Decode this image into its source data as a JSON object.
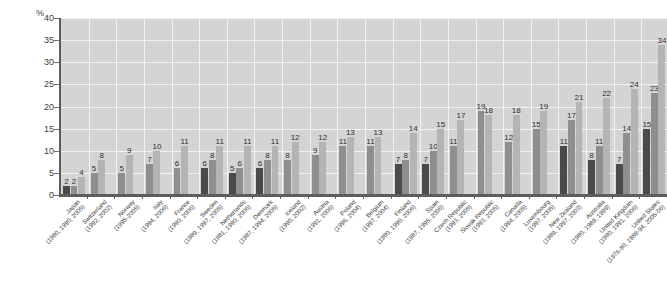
{
  "chart": {
    "type": "bar",
    "title": "",
    "y_unit_label": "%",
    "ylabel": "%",
    "xlabel": "",
    "ylim": [
      0,
      40
    ],
    "y_ticks": [
      0,
      5,
      10,
      15,
      20,
      25,
      30,
      35,
      40
    ],
    "grid": "horizontal-and-vertical",
    "legend": "none",
    "note_last_bar_clipped": "34"
  },
  "chart_data": {
    "type": "bar",
    "title": "",
    "xlabel": "",
    "ylabel": "%",
    "ylim": [
      0,
      40
    ],
    "y_ticks": [
      0,
      5,
      10,
      15,
      20,
      25,
      30,
      35,
      40
    ],
    "grid": true,
    "legend_position": "none",
    "categories": [
      "Japan",
      "Switzerland",
      "Norway",
      "Italy",
      "France",
      "Sweden",
      "Netherlands",
      "Denmark",
      "Iceland",
      "Austria",
      "Poland",
      "Belgium",
      "Finland",
      "Spain",
      "Czech Republic",
      "Slovak Republic",
      "Canada",
      "Luxembourg",
      "New Zealand",
      "Australia",
      "United Kingdom",
      "United States"
    ],
    "category_years": [
      "(1980, 1990, 2005)",
      "(1992, 2002)",
      "(1995-2005)",
      "(1994, 2006)",
      "(1990, 2006)",
      "(1989, 1997, 2005)",
      "(1981, 1990, 2006)",
      "(1987, 1994, 2005)",
      "(1990, 2002)",
      "(1991, 2006)",
      "(1996, 2004)",
      "(1997, 2004)",
      "(1980, 1990, 2006)",
      "(1987, 1995, 2006)",
      "(1993, 2005)",
      "(1993, 2005)",
      "(1994, 2005)",
      "(1997, 2005)",
      "(1989, 1997, 2003)",
      "(1980, 1989, 1999)",
      "(1980, 1991, 2006)",
      "(1976-80, 1988-94, 2005-06)"
    ],
    "bars": [
      {
        "category": "Japan",
        "values": [
          2,
          2,
          4
        ]
      },
      {
        "category": "Switzerland",
        "values": [
          5,
          8
        ]
      },
      {
        "category": "Norway",
        "values": [
          5,
          9
        ]
      },
      {
        "category": "Italy",
        "values": [
          7,
          10
        ]
      },
      {
        "category": "France",
        "values": [
          6,
          11
        ]
      },
      {
        "category": "Sweden",
        "values": [
          6,
          8,
          11
        ]
      },
      {
        "category": "Netherlands",
        "values": [
          5,
          6,
          11
        ]
      },
      {
        "category": "Denmark",
        "values": [
          6,
          8,
          11
        ]
      },
      {
        "category": "Iceland",
        "values": [
          8,
          12
        ]
      },
      {
        "category": "Austria",
        "values": [
          9,
          12
        ]
      },
      {
        "category": "Poland",
        "values": [
          11,
          13
        ]
      },
      {
        "category": "Belgium",
        "values": [
          11,
          13
        ]
      },
      {
        "category": "Finland",
        "values": [
          7,
          8,
          14
        ]
      },
      {
        "category": "Spain",
        "values": [
          7,
          10,
          15
        ]
      },
      {
        "category": "Czech Republic",
        "values": [
          11,
          17
        ]
      },
      {
        "category": "Slovak Republic",
        "values": [
          19,
          18
        ]
      },
      {
        "category": "Canada",
        "values": [
          12,
          18
        ]
      },
      {
        "category": "Luxembourg",
        "values": [
          15,
          19
        ]
      },
      {
        "category": "New Zealand",
        "values": [
          11,
          17,
          21
        ]
      },
      {
        "category": "Australia",
        "values": [
          8,
          11,
          22
        ]
      },
      {
        "category": "United Kingdom",
        "values": [
          7,
          14,
          24
        ]
      },
      {
        "category": "United States",
        "values": [
          15,
          23,
          34
        ]
      }
    ],
    "series": [
      {
        "name": "earliest year",
        "values": [
          2,
          5,
          5,
          7,
          6,
          6,
          5,
          6,
          8,
          9,
          11,
          11,
          7,
          7,
          11,
          19,
          12,
          15,
          11,
          8,
          7,
          15
        ]
      },
      {
        "name": "middle year",
        "values": [
          2,
          8,
          9,
          10,
          11,
          8,
          6,
          8,
          12,
          12,
          13,
          13,
          8,
          10,
          17,
          18,
          18,
          19,
          17,
          11,
          14,
          23
        ]
      },
      {
        "name": "latest year",
        "values": [
          4,
          null,
          null,
          null,
          null,
          11,
          11,
          11,
          null,
          null,
          null,
          null,
          14,
          15,
          null,
          null,
          null,
          null,
          21,
          22,
          24,
          34
        ]
      }
    ]
  },
  "colors": {
    "plot_background": "#d4d4d4",
    "gridline": "#f2f2f2",
    "axis": "#5d5d5d",
    "bar_dark": "#4a4a4a",
    "bar_mid": "#8e8e8e",
    "bar_light": "#b4b4b4",
    "text": "#3c3c3c"
  }
}
